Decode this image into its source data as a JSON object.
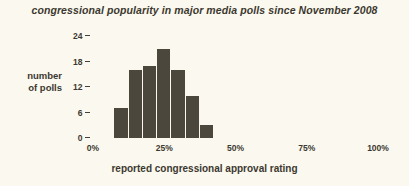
{
  "chart_data": {
    "type": "bar",
    "title": "congressional popularity in major media polls since November 2008",
    "xlabel": "reported congressional approval rating",
    "ylabel": "number of polls",
    "ylabel_lines": [
      "number",
      "of polls"
    ],
    "grid": false,
    "legend": "none",
    "xlim": [
      0,
      100
    ],
    "ylim": [
      0,
      24
    ],
    "x_tick_labels": [
      "0%",
      "25%",
      "50%",
      "75%",
      "100%"
    ],
    "x_tick_values": [
      0,
      25,
      50,
      75,
      100
    ],
    "y_tick_labels": [
      "0",
      "6",
      "12",
      "18",
      "24"
    ],
    "y_tick_values": [
      0,
      6,
      12,
      18,
      24
    ],
    "bin_width": 5,
    "categories": [
      "7.5%",
      "12.5%",
      "17.5%",
      "22.5%",
      "27.5%",
      "32.5%",
      "37.5%"
    ],
    "bin_starts": [
      7.5,
      12.5,
      17.5,
      22.5,
      27.5,
      32.5,
      37.5
    ],
    "values": [
      7,
      16,
      17,
      21,
      16,
      10,
      3
    ],
    "colors": {
      "background": "#fbf9ef",
      "bar": "#4b473d",
      "text": "#3c3830"
    }
  }
}
